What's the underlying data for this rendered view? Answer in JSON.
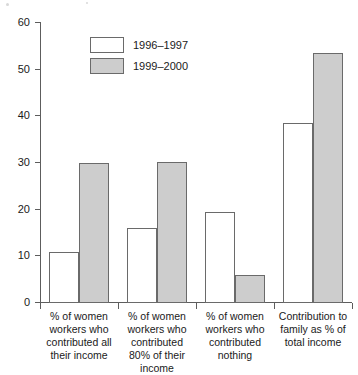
{
  "chart_data": {
    "type": "bar",
    "title": "",
    "xlabel": "",
    "ylabel": "",
    "ylim": [
      0,
      60
    ],
    "yticks": [
      0,
      10,
      20,
      30,
      40,
      50,
      60
    ],
    "grid": false,
    "legend_position": "top-left",
    "categories": [
      "% of women workers who contributed all their income",
      "% of women workers who contributed 80% of their income",
      "% of women workers who contributed nothing",
      "Contribution to family as % of total income"
    ],
    "series": [
      {
        "name": "1996–1997",
        "color": "#ffffff",
        "values": [
          11,
          16,
          19.5,
          38.5
        ]
      },
      {
        "name": "1999–2000",
        "color": "#cdcdcd",
        "values": [
          30,
          30.3,
          6,
          53.5
        ]
      }
    ]
  },
  "legend": {
    "items": [
      {
        "label": "1996–1997",
        "swatch": "white-swatch"
      },
      {
        "label": "1999–2000",
        "swatch": "gray-swatch"
      }
    ]
  },
  "axis": {
    "y_tick_labels": [
      "0",
      "10",
      "20",
      "30",
      "40",
      "50",
      "60"
    ]
  }
}
